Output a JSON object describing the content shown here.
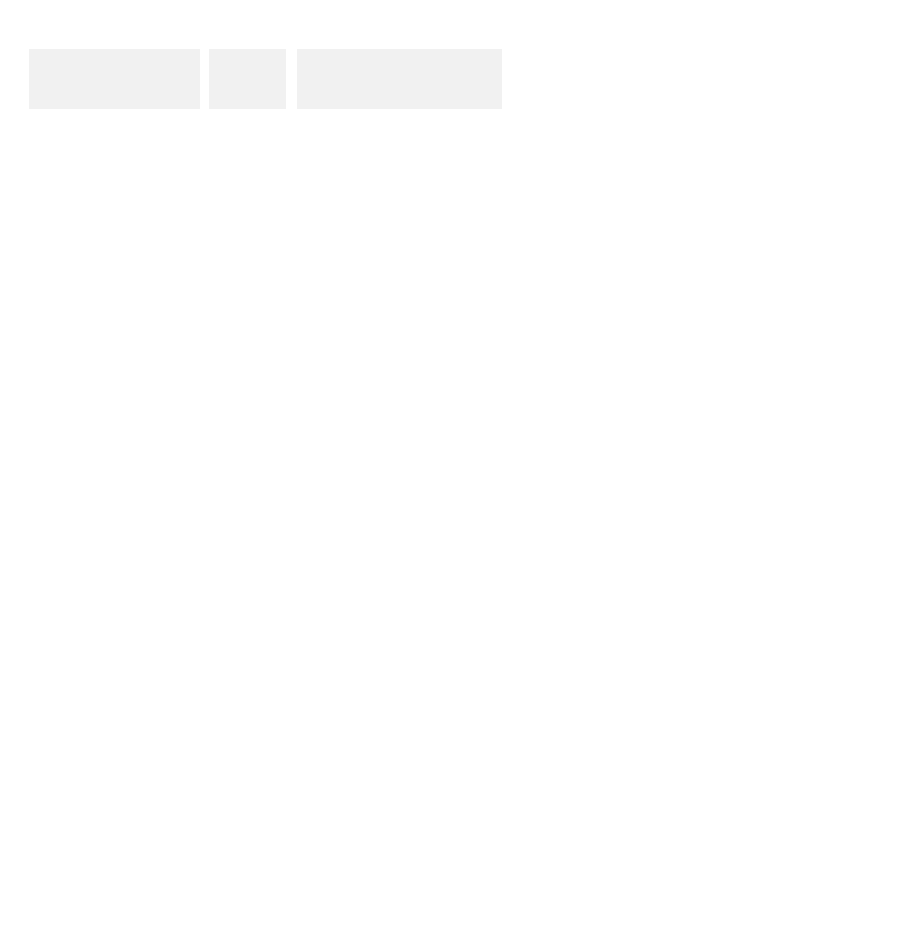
{
  "headers": {
    "col1_line1": "gene regulatory proteins",
    "col1_line2_pre": "produced by ",
    "col1_line2_italic": "MAT",
    "col1_line2_post": " locus",
    "col2": "cell type",
    "col3_pre": "set of genes controlled by ",
    "col3_italic": "MAT"
  },
  "colors": {
    "header_bg": "#f1f1f1",
    "dark_protein": "#4a4a4a",
    "mid_protein": "#8c8c8c",
    "light_protein": "#bdbdbd",
    "gene_dark": "#7a7a7a",
    "gene_light": "#d6d6d6",
    "cell_type_text": "#999999"
  },
  "rows": [
    {
      "locus_label": "a",
      "proteins": [
        {
          "name": "a1",
          "note": "(no effect)"
        }
      ],
      "cell_type": {
        "name": "a",
        "ploidy": "(haploid)"
      },
      "genes": [
        {
          "name_bold": "a",
          "name_rest": "SG",
          "state": "ON",
          "bound": "Mcm1"
        },
        {
          "name_bold": "",
          "name_rest": "αSG",
          "state": "OFF"
        },
        {
          "name_bold": "",
          "name_rest": "hSG",
          "state": "ON"
        }
      ]
    },
    {
      "locus_label": "α",
      "proteins": [
        {
          "name": "α1"
        },
        {
          "name": "α2"
        }
      ],
      "cell_type": {
        "name": "α",
        "ploidy": "(haploid)"
      },
      "genes": [
        {
          "name_bold": "a",
          "name_rest": "SG",
          "state": "OFF",
          "bound_labels": [
            "Mcm1",
            "α2"
          ]
        },
        {
          "name_bold": "",
          "name_rest": "αSG",
          "state": "ON",
          "bound_labels": [
            "α1",
            "Mcm1"
          ]
        },
        {
          "name_bold": "",
          "name_rest": "hSG",
          "state": "ON"
        }
      ]
    },
    {
      "locus_labels": [
        "α",
        "a"
      ],
      "proteins": [
        {
          "name": "α2"
        },
        {
          "name": "a1"
        }
      ],
      "cell_type": {
        "name": "a/α",
        "ploidy": "(diploid)"
      },
      "genes": [
        {
          "name_bold": "a",
          "name_rest": "SG",
          "state": "OFF",
          "bound_labels": [
            "Mcm1",
            "α2"
          ]
        },
        {
          "name_bold": "",
          "name_rest": "αSG",
          "state": "OFF"
        },
        {
          "name_bold": "",
          "name_rest": "hSG",
          "state": "OFF",
          "bound_labels": [
            "α2",
            "a1"
          ]
        }
      ]
    }
  ]
}
